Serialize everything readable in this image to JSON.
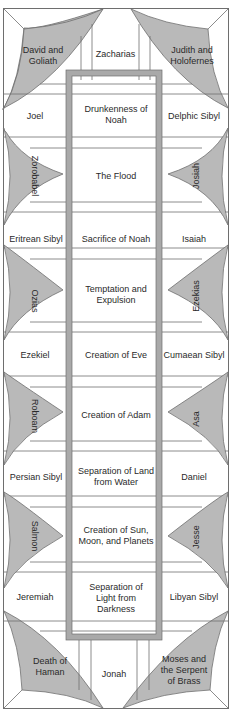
{
  "colors": {
    "line": "#6e6e6e",
    "frame": "#a9a9a9",
    "spandrel_fill": "#b9b9b9",
    "background": "#ffffff",
    "text": "#2a2a2a"
  },
  "corners": {
    "top_left": "David and Goliath",
    "top_right": "Judith and Holofernes",
    "bottom_left": "Death of Haman",
    "bottom_right": "Moses and the Serpent of Brass"
  },
  "end_prophets": {
    "top": "Zacharias",
    "bottom": "Jonah"
  },
  "seer_rows": [
    {
      "left": "Joel",
      "center": "Drunkenness of Noah",
      "right": "Delphic Sibyl"
    },
    {
      "left": "Eritrean Sibyl",
      "center": "Sacrifice of Noah",
      "right": "Isaiah"
    },
    {
      "left": "Ezekiel",
      "center": "Creation of Eve",
      "right": "Cumaean Sibyl"
    },
    {
      "left": "Persian Sibyl",
      "center": "Separation of Land from Water",
      "right": "Daniel"
    },
    {
      "left": "Jeremiah",
      "center": "Separation of Light from Darkness",
      "right": "Libyan Sibyl"
    }
  ],
  "spandrel_rows": [
    {
      "left": "Zorobabel",
      "center": "The Flood",
      "right": "Josiah"
    },
    {
      "left": "Ozias",
      "center": "Temptation and Expulsion",
      "right": "Ezekias"
    },
    {
      "left": "Roboam",
      "center": "Creation of Adam",
      "right": "Asa"
    },
    {
      "left": "Salmon",
      "center": "Creation of Sun, Moon, and Planets",
      "right": "Jesse"
    }
  ]
}
